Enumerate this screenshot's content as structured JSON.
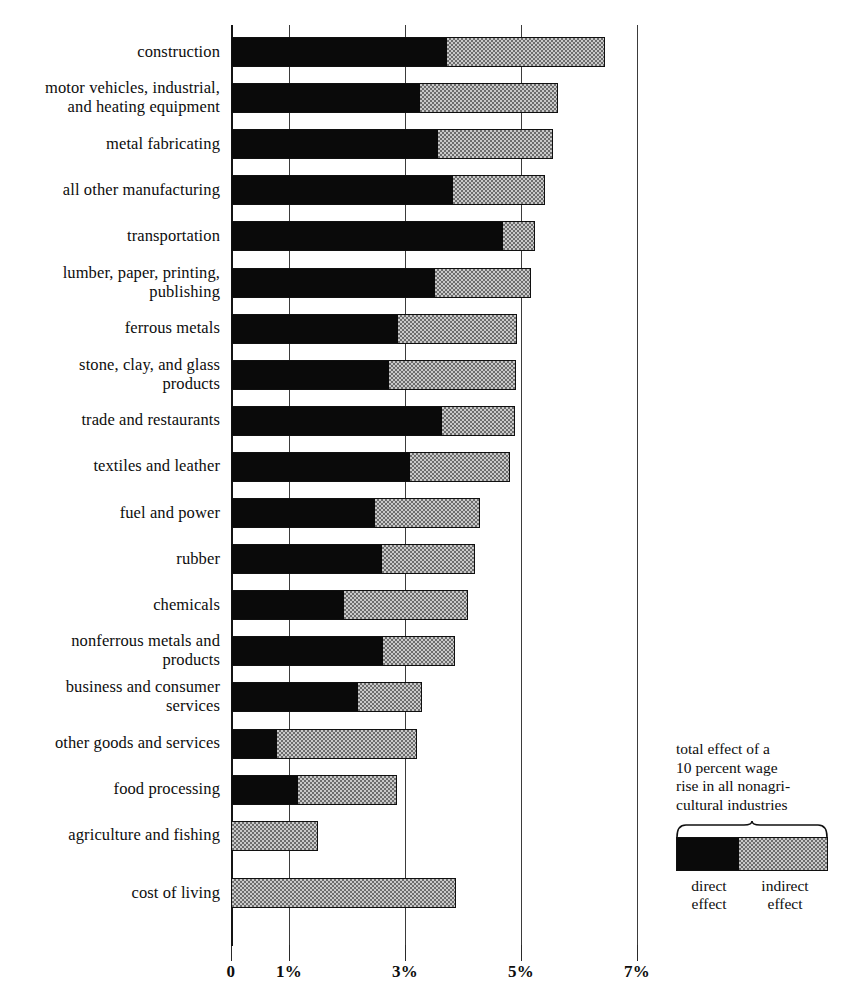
{
  "chart_data": {
    "type": "bar",
    "orientation": "horizontal",
    "stacked": true,
    "title": "",
    "xlabel": "",
    "ylabel": "",
    "xlim": [
      0,
      7.1
    ],
    "grid": true,
    "legend_position": "bottom-right",
    "axis": {
      "ticks": [
        {
          "value": 0,
          "label": "0"
        },
        {
          "value": 1,
          "label": "1%"
        },
        {
          "value": 3,
          "label": "3%"
        },
        {
          "value": 5,
          "label": "5%"
        },
        {
          "value": 7,
          "label": "7%"
        }
      ]
    },
    "series": [
      {
        "name": "direct effect",
        "color": "#0a0a0a"
      },
      {
        "name": "indirect effect",
        "color": "#c9c9c9"
      }
    ],
    "categories": [
      "construction",
      "motor vehicles, industrial,\nand heating equipment",
      "metal fabricating",
      "all other manufacturing",
      "transportation",
      "lumber, paper,  printing,\npublishing",
      "ferrous metals",
      "stone, clay, and glass\nproducts",
      "trade and restaurants",
      "textiles and leather",
      "fuel and power",
      "rubber",
      "chemicals",
      "nonferrous metals and\nproducts",
      "business and consumer\nservices",
      "other goods and services",
      "food processing",
      "agriculture and fishing",
      "cost of living"
    ],
    "rows": [
      {
        "label": "construction",
        "direct": 3.72,
        "indirect": 2.73,
        "total": 6.45
      },
      {
        "label": "motor vehicles, industrial,\nand heating equipment",
        "direct": 3.26,
        "indirect": 2.38,
        "total": 5.64
      },
      {
        "label": "metal fabricating",
        "direct": 3.57,
        "indirect": 1.98,
        "total": 5.55
      },
      {
        "label": "all other manufacturing",
        "direct": 3.83,
        "indirect": 1.58,
        "total": 5.41
      },
      {
        "label": "transportation",
        "direct": 4.69,
        "indirect": 0.55,
        "total": 5.24
      },
      {
        "label": "lumber, paper,  printing,\npublishing",
        "direct": 3.52,
        "indirect": 1.65,
        "total": 5.17
      },
      {
        "label": "ferrous metals",
        "direct": 2.88,
        "indirect": 2.05,
        "total": 4.93
      },
      {
        "label": "stone, clay, and glass\nproducts",
        "direct": 2.72,
        "indirect": 2.19,
        "total": 4.91
      },
      {
        "label": "trade and restaurants",
        "direct": 3.64,
        "indirect": 1.26,
        "total": 4.9
      },
      {
        "label": "textiles and leather",
        "direct": 3.09,
        "indirect": 1.72,
        "total": 4.81
      },
      {
        "label": "fuel and power",
        "direct": 2.48,
        "indirect": 1.81,
        "total": 4.29
      },
      {
        "label": "rubber",
        "direct": 2.6,
        "indirect": 1.61,
        "total": 4.21
      },
      {
        "label": "chemicals",
        "direct": 1.95,
        "indirect": 2.14,
        "total": 4.09
      },
      {
        "label": "nonferrous metals and\nproducts",
        "direct": 2.62,
        "indirect": 1.24,
        "total": 3.86
      },
      {
        "label": "business and consumer\nservices",
        "direct": 2.19,
        "indirect": 1.1,
        "total": 3.29
      },
      {
        "label": "other goods and services",
        "direct": 0.79,
        "indirect": 2.42,
        "total": 3.21
      },
      {
        "label": "food processing",
        "direct": 1.16,
        "indirect": 1.7,
        "total": 2.86
      },
      {
        "label": "agriculture and fishing",
        "direct": 0.0,
        "indirect": 1.5,
        "total": 1.5
      },
      {
        "label": "cost of living",
        "direct": 0.0,
        "indirect": 3.88,
        "total": 3.88
      }
    ]
  },
  "legend": {
    "caption": "total effect of a\n10 percent wage\nrise in all nonagri-\ncultural industries",
    "direct_label": "direct\neffect",
    "indirect_label": "indirect\neffect"
  }
}
